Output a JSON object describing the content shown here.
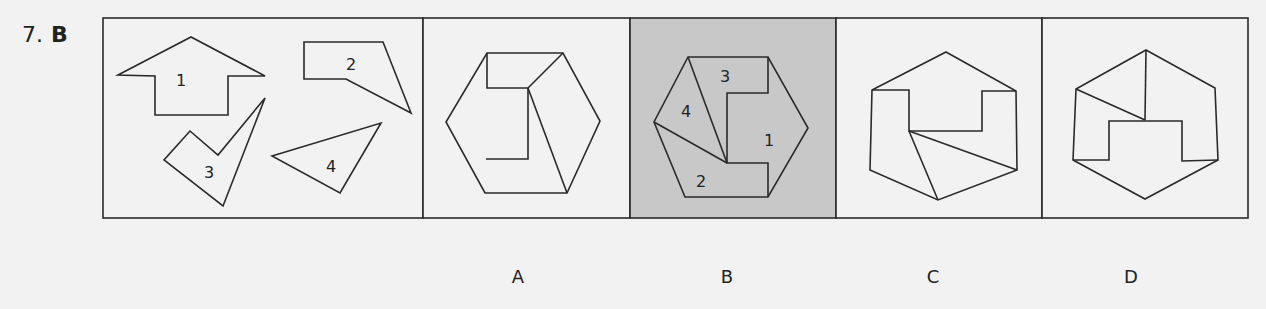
{
  "question": {
    "number": "7.",
    "answer": "B"
  },
  "colors": {
    "background": "#f2f2f2",
    "line": "#2a2a2a",
    "selected_fill": "#c8c8c8"
  },
  "pieces": [
    {
      "id": "1",
      "label": "1"
    },
    {
      "id": "2",
      "label": "2"
    },
    {
      "id": "3",
      "label": "3"
    },
    {
      "id": "4",
      "label": "4"
    }
  ],
  "options": [
    {
      "letter": "A",
      "selected": false
    },
    {
      "letter": "B",
      "selected": true,
      "piece_labels": [
        "3",
        "4",
        "1",
        "2"
      ]
    },
    {
      "letter": "C",
      "selected": false
    },
    {
      "letter": "D",
      "selected": false
    }
  ]
}
